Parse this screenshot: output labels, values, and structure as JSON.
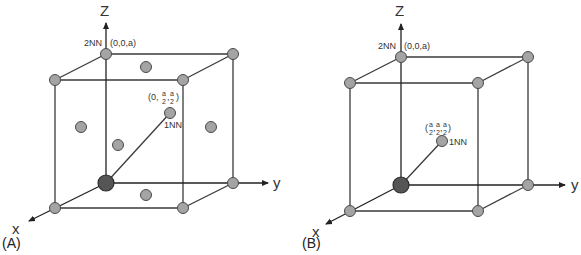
{
  "figure": {
    "panels": [
      {
        "id": "A",
        "label": "(A)",
        "lattice": "fcc",
        "axis_labels": {
          "z": "Z",
          "y": "y",
          "x": "x"
        },
        "second_nn": {
          "label": "2NN",
          "coord": "(0,0,a)"
        },
        "first_nn": {
          "label": "1NN",
          "coord_prefix": "(0,",
          "coord_num": "a",
          "coord_den": "2",
          "coord_suffix": ")"
        }
      },
      {
        "id": "B",
        "label": "(B)",
        "lattice": "bcc",
        "axis_labels": {
          "z": "Z",
          "y": "y",
          "x": "x"
        },
        "second_nn": {
          "label": "2NN",
          "coord": "(0,0,a)"
        },
        "first_nn": {
          "label": "1NN",
          "coord_prefix": "(",
          "coord_num": "a",
          "coord_den": "2",
          "coord_suffix": ")"
        }
      }
    ],
    "colors": {
      "atom": "#a4a4a4",
      "origin_atom": "#555555",
      "line": "#3a3a3a"
    }
  }
}
